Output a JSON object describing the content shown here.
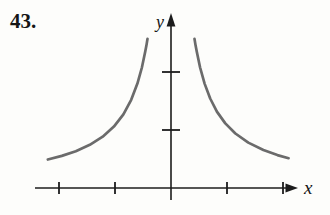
{
  "figure": {
    "problem_number": "43.",
    "caption": ""
  },
  "colors": {
    "curve": "#6b6b6b",
    "axis": "#1c1c1c",
    "text": "#151515",
    "background": "#fdfdfb"
  },
  "chart_data": {
    "type": "line",
    "title": "",
    "xlabel": "x",
    "ylabel": "y",
    "grid": false,
    "legend": false,
    "xlim": [
      -2.45,
      2.3
    ],
    "ylim": [
      -0.25,
      3.1
    ],
    "x_ticks": [
      -2,
      -1,
      1,
      2
    ],
    "y_ticks": [
      1,
      2
    ],
    "series": [
      {
        "name": "left-branch",
        "points": [
          [
            -2.2,
            0.491
          ],
          [
            -1.95,
            0.554
          ],
          [
            -1.7,
            0.635
          ],
          [
            -1.45,
            0.745
          ],
          [
            -1.22,
            0.885
          ],
          [
            -1.02,
            1.059
          ],
          [
            -0.85,
            1.271
          ],
          [
            -0.71,
            1.521
          ],
          [
            -0.6,
            1.8
          ],
          [
            -0.52,
            2.077
          ],
          [
            -0.46,
            2.348
          ],
          [
            -0.44,
            2.455
          ],
          [
            -0.42,
            2.571
          ]
        ]
      },
      {
        "name": "right-branch",
        "points": [
          [
            0.42,
            2.571
          ],
          [
            0.44,
            2.455
          ],
          [
            0.46,
            2.348
          ],
          [
            0.52,
            2.077
          ],
          [
            0.6,
            1.8
          ],
          [
            0.7,
            1.543
          ],
          [
            0.82,
            1.317
          ],
          [
            0.97,
            1.113
          ],
          [
            1.15,
            0.939
          ],
          [
            1.38,
            0.783
          ],
          [
            1.65,
            0.655
          ],
          [
            1.9,
            0.568
          ],
          [
            2.1,
            0.514
          ]
        ]
      }
    ]
  }
}
